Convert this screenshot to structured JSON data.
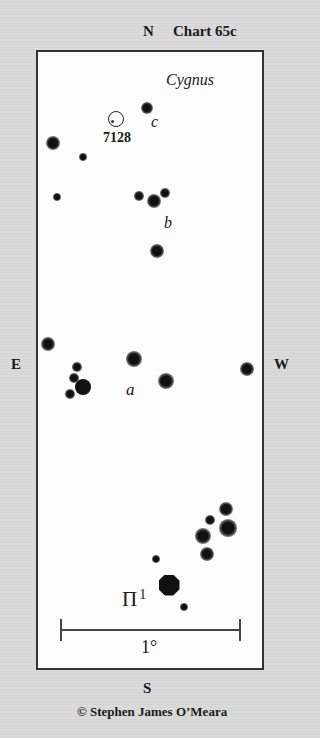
{
  "header": {
    "north_label": "N",
    "chart_title": "Chart 65c"
  },
  "constellation": "Cygnus",
  "directions": {
    "north": "N",
    "east": "E",
    "west": "W",
    "south": "S"
  },
  "labels": {
    "cluster_id": "7128",
    "star_a": "a",
    "star_b": "b",
    "star_c": "c",
    "bright_star": "Π",
    "bright_star_sup": "1"
  },
  "scale": {
    "label": "1°"
  },
  "credit": "© Stephen James O’Meara",
  "colors": {
    "background": "#d9d9d9",
    "chart_field": "#fcfcfc",
    "frame": "#333333",
    "star": "#111111"
  },
  "cluster": {
    "name": "7128",
    "x": 115,
    "y": 118,
    "r": 7
  },
  "stars": [
    {
      "x": 147,
      "y": 108,
      "r": 4
    },
    {
      "x": 53,
      "y": 143,
      "r": 4.5
    },
    {
      "x": 83,
      "y": 157,
      "r": 2.5
    },
    {
      "x": 57,
      "y": 197,
      "r": 2.5
    },
    {
      "x": 139,
      "y": 196,
      "r": 3
    },
    {
      "x": 154,
      "y": 201,
      "r": 4.5
    },
    {
      "x": 165,
      "y": 193,
      "r": 3
    },
    {
      "x": 157,
      "y": 251,
      "r": 4.5
    },
    {
      "x": 48,
      "y": 344,
      "r": 4.5
    },
    {
      "x": 134,
      "y": 359,
      "r": 5
    },
    {
      "x": 247,
      "y": 369,
      "r": 4.5
    },
    {
      "x": 77,
      "y": 367,
      "r": 3
    },
    {
      "x": 74,
      "y": 378,
      "r": 3
    },
    {
      "x": 83,
      "y": 387,
      "r": 7.5,
      "type": "solid"
    },
    {
      "x": 70,
      "y": 394,
      "r": 3
    },
    {
      "x": 166,
      "y": 381,
      "r": 5
    },
    {
      "x": 226,
      "y": 509,
      "r": 4.5
    },
    {
      "x": 210,
      "y": 520,
      "r": 3
    },
    {
      "x": 228,
      "y": 528,
      "r": 5.5
    },
    {
      "x": 203,
      "y": 536,
      "r": 5
    },
    {
      "x": 207,
      "y": 554,
      "r": 4.5
    },
    {
      "x": 156,
      "y": 559,
      "r": 2.5
    },
    {
      "x": 169,
      "y": 585,
      "r": 10.5,
      "type": "huge"
    },
    {
      "x": 184,
      "y": 607,
      "r": 2.5
    }
  ]
}
